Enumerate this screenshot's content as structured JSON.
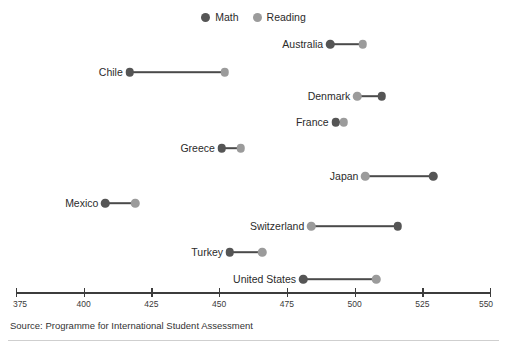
{
  "legend": {
    "entries": [
      {
        "label": "Math",
        "color": "#555555"
      },
      {
        "label": "Reading",
        "color": "#9b9b9b"
      }
    ]
  },
  "source": {
    "text": "Source: Programme for International Student Assessment"
  },
  "chart_data": {
    "type": "scatter",
    "subtype": "dumbbell",
    "title": "",
    "subtitle": "",
    "xlabel": "",
    "ylabel": "",
    "xlim": [
      375,
      550
    ],
    "xticks": [
      375,
      400,
      425,
      450,
      475,
      500,
      525,
      550
    ],
    "xtick_labels": [
      "375",
      "400",
      "425",
      "450",
      "475",
      "500",
      "525",
      "550"
    ],
    "grid": false,
    "legend_position": "top-center",
    "categories": [
      "Australia",
      "Chile",
      "Denmark",
      "France",
      "Greece",
      "Japan",
      "Mexico",
      "Switzerland",
      "Turkey",
      "United States"
    ],
    "series": [
      {
        "name": "Math",
        "color": "#555555",
        "values": [
          491,
          417,
          510,
          493,
          451,
          529,
          408,
          516,
          454,
          481
        ]
      },
      {
        "name": "Reading",
        "color": "#9b9b9b",
        "values": [
          503,
          452,
          501,
          496,
          458,
          504,
          419,
          484,
          466,
          508
        ]
      }
    ],
    "rows": [
      {
        "category": "Australia",
        "math": 491,
        "reading": 503
      },
      {
        "category": "Chile",
        "math": 417,
        "reading": 452
      },
      {
        "category": "Denmark",
        "math": 510,
        "reading": 501
      },
      {
        "category": "France",
        "math": 493,
        "reading": 496
      },
      {
        "category": "Greece",
        "math": 451,
        "reading": 458
      },
      {
        "category": "Japan",
        "math": 529,
        "reading": 504
      },
      {
        "category": "Mexico",
        "math": 408,
        "reading": 419
      },
      {
        "category": "Switzerland",
        "math": 516,
        "reading": 484
      },
      {
        "category": "Turkey",
        "math": 454,
        "reading": 466
      },
      {
        "category": "United States",
        "math": 481,
        "reading": 508
      }
    ]
  }
}
